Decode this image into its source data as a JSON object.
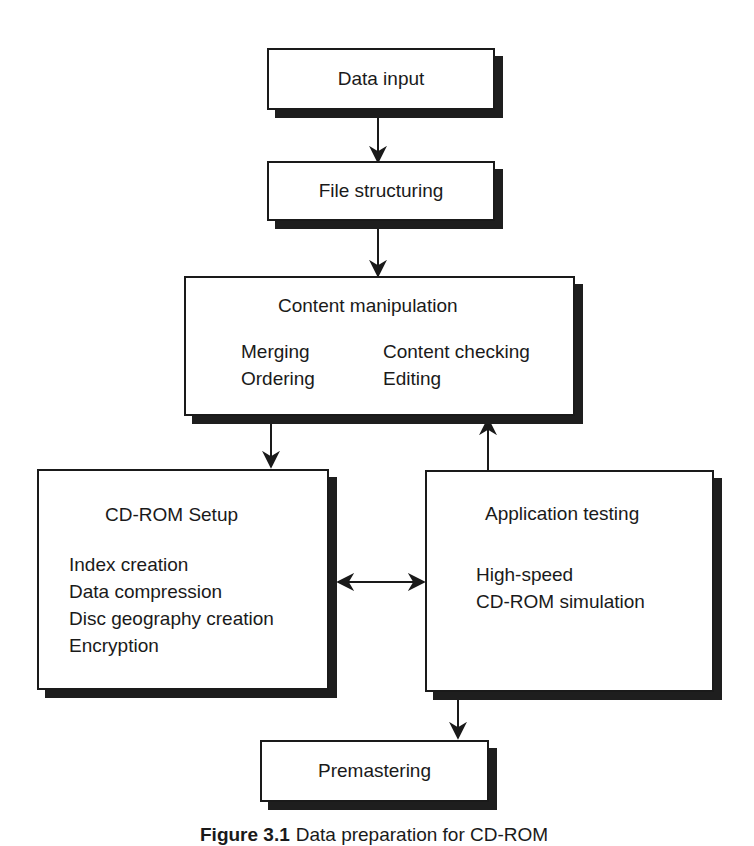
{
  "boxes": {
    "data_input": {
      "title": "Data input"
    },
    "file_structuring": {
      "title": "File structuring"
    },
    "content_manipulation": {
      "title": "Content manipulation",
      "col1": [
        "Merging",
        "Ordering"
      ],
      "col2": [
        "Content checking",
        "Editing"
      ]
    },
    "cdrom_setup": {
      "title": "CD-ROM Setup",
      "items": [
        "Index creation",
        "Data compression",
        "Disc geography creation",
        "Encryption"
      ]
    },
    "application_testing": {
      "title": "Application testing",
      "items": [
        "High-speed",
        "CD-ROM simulation"
      ]
    },
    "premastering": {
      "title": "Premastering"
    }
  },
  "caption": {
    "label": "Figure 3.1",
    "text": "Data preparation for CD-ROM"
  }
}
